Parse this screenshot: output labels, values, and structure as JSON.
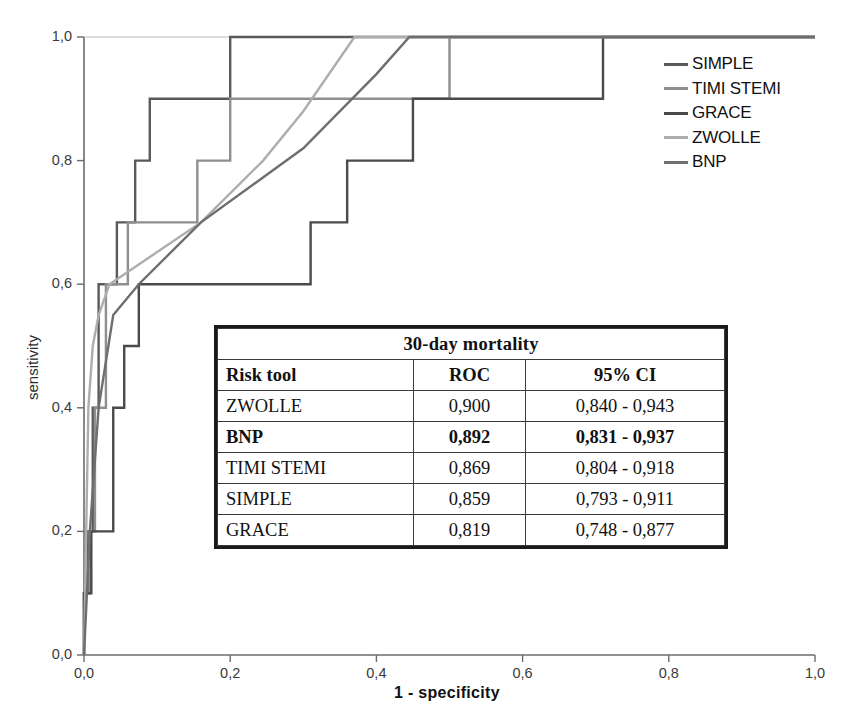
{
  "chart_data": {
    "type": "line",
    "title": "",
    "xlabel": "1 - specificity",
    "ylabel": "sensitivity",
    "xlim": [
      0.0,
      1.0
    ],
    "ylim": [
      0.0,
      1.0
    ],
    "xticks": [
      "0,0",
      "0,2",
      "0,4",
      "0,6",
      "0,8",
      "1,0"
    ],
    "xtick_values": [
      0.0,
      0.2,
      0.4,
      0.6,
      0.8,
      1.0
    ],
    "yticks": [
      "0,0",
      "0,2",
      "0,4",
      "0,6",
      "0,8",
      "1,0"
    ],
    "ytick_values": [
      0.0,
      0.2,
      0.4,
      0.6,
      0.8,
      1.0
    ],
    "grid": false,
    "legend_position": "top-right",
    "series": [
      {
        "name": "SIMPLE",
        "color": "#5a5a5a",
        "style": "step",
        "points": [
          [
            0.0,
            0.0
          ],
          [
            0.0,
            0.1
          ],
          [
            0.005,
            0.1
          ],
          [
            0.005,
            0.2
          ],
          [
            0.012,
            0.2
          ],
          [
            0.012,
            0.4
          ],
          [
            0.02,
            0.4
          ],
          [
            0.02,
            0.6
          ],
          [
            0.045,
            0.6
          ],
          [
            0.045,
            0.7
          ],
          [
            0.07,
            0.7
          ],
          [
            0.07,
            0.8
          ],
          [
            0.09,
            0.8
          ],
          [
            0.09,
            0.9
          ],
          [
            0.2,
            0.9
          ],
          [
            0.2,
            1.0
          ],
          [
            1.0,
            1.0
          ]
        ]
      },
      {
        "name": "TIMI STEMI",
        "color": "#8f8f8f",
        "style": "step",
        "points": [
          [
            0.0,
            0.0
          ],
          [
            0.0,
            0.1
          ],
          [
            0.008,
            0.1
          ],
          [
            0.008,
            0.2
          ],
          [
            0.015,
            0.2
          ],
          [
            0.015,
            0.4
          ],
          [
            0.03,
            0.4
          ],
          [
            0.03,
            0.6
          ],
          [
            0.06,
            0.6
          ],
          [
            0.06,
            0.7
          ],
          [
            0.155,
            0.7
          ],
          [
            0.155,
            0.8
          ],
          [
            0.2,
            0.8
          ],
          [
            0.2,
            0.9
          ],
          [
            0.5,
            0.9
          ],
          [
            0.5,
            1.0
          ],
          [
            1.0,
            1.0
          ]
        ]
      },
      {
        "name": "GRACE",
        "color": "#4a4a4a",
        "style": "step",
        "points": [
          [
            0.0,
            0.0
          ],
          [
            0.0,
            0.1
          ],
          [
            0.01,
            0.1
          ],
          [
            0.01,
            0.2
          ],
          [
            0.04,
            0.2
          ],
          [
            0.04,
            0.4
          ],
          [
            0.055,
            0.4
          ],
          [
            0.055,
            0.5
          ],
          [
            0.075,
            0.5
          ],
          [
            0.075,
            0.6
          ],
          [
            0.31,
            0.6
          ],
          [
            0.31,
            0.7
          ],
          [
            0.36,
            0.7
          ],
          [
            0.36,
            0.8
          ],
          [
            0.45,
            0.8
          ],
          [
            0.45,
            0.9
          ],
          [
            0.71,
            0.9
          ],
          [
            0.71,
            1.0
          ],
          [
            1.0,
            1.0
          ]
        ]
      },
      {
        "name": "ZWOLLE",
        "color": "#adadad",
        "style": "smooth",
        "points": [
          [
            0.0,
            0.0
          ],
          [
            0.006,
            0.4
          ],
          [
            0.012,
            0.5
          ],
          [
            0.02,
            0.55
          ],
          [
            0.035,
            0.6
          ],
          [
            0.16,
            0.7
          ],
          [
            0.245,
            0.8
          ],
          [
            0.3,
            0.88
          ],
          [
            0.37,
            1.0
          ],
          [
            1.0,
            1.0
          ]
        ]
      },
      {
        "name": "BNP",
        "color": "#6e6e6e",
        "style": "smooth",
        "points": [
          [
            0.0,
            0.0
          ],
          [
            0.008,
            0.2
          ],
          [
            0.02,
            0.4
          ],
          [
            0.04,
            0.55
          ],
          [
            0.075,
            0.6
          ],
          [
            0.16,
            0.7
          ],
          [
            0.3,
            0.82
          ],
          [
            0.4,
            0.94
          ],
          [
            0.445,
            1.0
          ],
          [
            1.0,
            1.0
          ]
        ]
      }
    ]
  },
  "legend": {
    "items": [
      {
        "label": "SIMPLE",
        "color": "#5a5a5a"
      },
      {
        "label": "TIMI STEMI",
        "color": "#8f8f8f"
      },
      {
        "label": "GRACE",
        "color": "#4a4a4a"
      },
      {
        "label": "ZWOLLE",
        "color": "#adadad"
      },
      {
        "label": "BNP",
        "color": "#6e6e6e"
      }
    ]
  },
  "results_table": {
    "title": "30-day mortality",
    "columns": [
      "Risk tool",
      "ROC",
      "95% CI"
    ],
    "rows": [
      {
        "tool": "ZWOLLE",
        "roc": "0,900",
        "ci": "0,840 - 0,943",
        "bold": false
      },
      {
        "tool": "BNP",
        "roc": "0,892",
        "ci": "0,831 - 0,937",
        "bold": true
      },
      {
        "tool": "TIMI STEMI",
        "roc": "0,869",
        "ci": "0,804 - 0,918",
        "bold": false
      },
      {
        "tool": "SIMPLE",
        "roc": "0,859",
        "ci": "0,793 - 0,911",
        "bold": false
      },
      {
        "tool": "GRACE",
        "roc": "0,819",
        "ci": "0,748 - 0,877",
        "bold": false
      }
    ]
  },
  "axes": {
    "x_title": "1 - specificity",
    "y_title": "sensitivity"
  }
}
